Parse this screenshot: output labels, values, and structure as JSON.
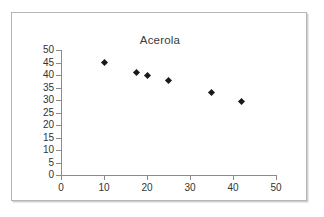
{
  "chart_data": {
    "type": "scatter",
    "title": "Acerola",
    "xlabel": "",
    "ylabel": "",
    "xlim": [
      0,
      50
    ],
    "ylim": [
      0,
      50
    ],
    "xticks": [
      0,
      10,
      20,
      30,
      40,
      50
    ],
    "yticks": [
      0,
      5,
      10,
      15,
      20,
      25,
      30,
      35,
      40,
      45,
      50
    ],
    "xtick_labels": [
      "0",
      "10",
      "20",
      "30",
      "40",
      "50"
    ],
    "ytick_labels": [
      "0",
      "5",
      "10",
      "15",
      "20",
      "25",
      "30",
      "35",
      "40",
      "45",
      "50"
    ],
    "grid": false,
    "legend": false,
    "series": [
      {
        "name": "Acerola",
        "marker": "diamond",
        "color": "#1a1a1a",
        "points": [
          {
            "x": 10,
            "y": 45
          },
          {
            "x": 17.5,
            "y": 41
          },
          {
            "x": 20,
            "y": 40
          },
          {
            "x": 25,
            "y": 38
          },
          {
            "x": 35,
            "y": 33
          },
          {
            "x": 42,
            "y": 29.5
          }
        ]
      }
    ]
  },
  "colors": {
    "axis": "#8a8a8a",
    "text": "#333333",
    "marker": "#1a1a1a",
    "frame": "#b6b6b6",
    "background": "#ffffff"
  }
}
